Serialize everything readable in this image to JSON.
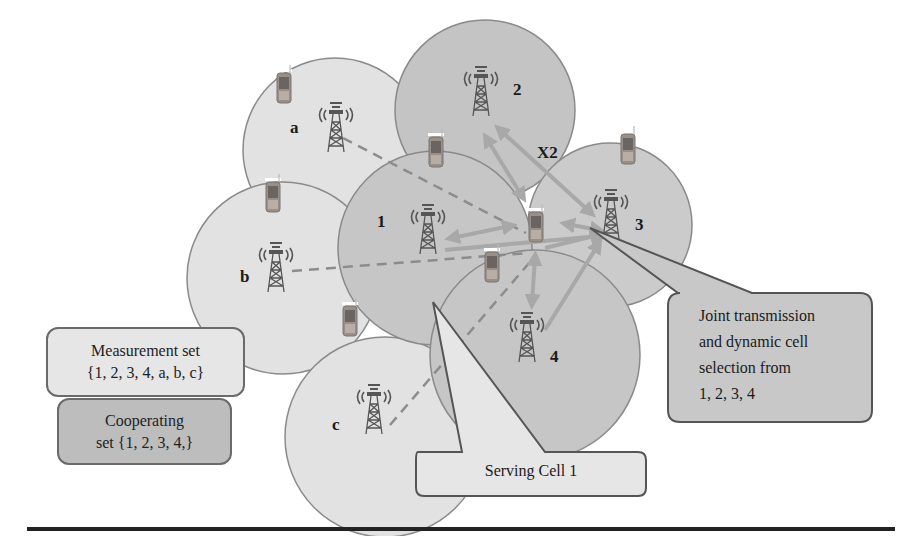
{
  "diagram": {
    "cells": [
      {
        "id": "a",
        "label": "a",
        "type": "measurement",
        "cx": 335,
        "cy": 150,
        "r": 92
      },
      {
        "id": "2",
        "label": "2",
        "type": "cooperating",
        "cx": 485,
        "cy": 110,
        "r": 90
      },
      {
        "id": "3",
        "label": "3",
        "type": "cooperating",
        "cx": 610,
        "cy": 225,
        "r": 82
      },
      {
        "id": "b",
        "label": "b",
        "type": "measurement",
        "cx": 283,
        "cy": 278,
        "r": 96
      },
      {
        "id": "1",
        "label": "1",
        "type": "cooperating",
        "cx": 435,
        "cy": 248,
        "r": 97
      },
      {
        "id": "4",
        "label": "4",
        "type": "cooperating",
        "cx": 535,
        "cy": 355,
        "r": 105
      },
      {
        "id": "c",
        "label": "c",
        "type": "measurement",
        "cx": 385,
        "cy": 437,
        "r": 100
      }
    ],
    "x2_label": "X2",
    "callouts": {
      "measurement_set": {
        "line1": "Measurement set",
        "line2": "{1, 2, 3, 4, a, b, c}"
      },
      "cooperating_set": {
        "line1": "Cooperating",
        "line2": "set {1, 2, 3, 4,}"
      },
      "serving_cell": "Serving Cell 1",
      "joint_transmission": {
        "line1": "Joint transmission",
        "line2": "and dynamic cell",
        "line3": "selection from",
        "line4": "1, 2, 3, 4"
      }
    },
    "colors": {
      "measurement_cell_fill": "#e2e2e2",
      "cooperating_cell_fill": "#c4c4c4",
      "cell_border": "#8a8a8a",
      "arrow": "#a8a8a8",
      "dashed_line": "#8c8c8c",
      "measurement_box_fill": "#e6e6e6",
      "cooperating_box_fill": "#bdbdbd",
      "joint_box_fill": "#c8c8c8",
      "serving_box_fill": "#e6e6e6"
    }
  }
}
